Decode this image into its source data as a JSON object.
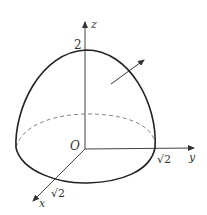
{
  "diagram": {
    "axes": {
      "z_label": "z",
      "y_label": "y",
      "x_label": "x",
      "origin_label": "O"
    },
    "ticks": {
      "z_top": "2",
      "y_intercept": "√2",
      "x_intercept": "√2"
    },
    "normal_vector": "outward normal arrow",
    "colors": {
      "stroke": "#222222",
      "axis": "#444444",
      "dashed": "#777777"
    }
  }
}
